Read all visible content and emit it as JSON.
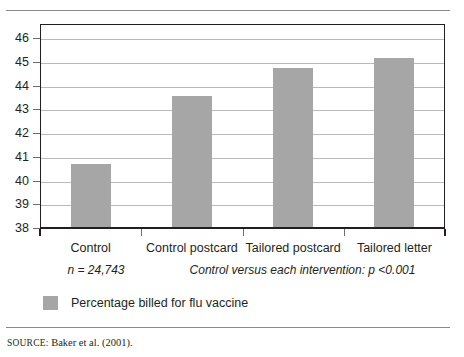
{
  "chart_data": {
    "type": "bar",
    "title": "",
    "subtitle": "",
    "xlabel": "",
    "ylabel": "",
    "categories": [
      "Control",
      "Control postcard",
      "Tailored postcard",
      "Tailored letter"
    ],
    "values": [
      40.7,
      43.55,
      44.75,
      45.15
    ],
    "series": [
      {
        "name": "Percentage billed for flu vaccine",
        "values": [
          40.7,
          43.55,
          44.75,
          45.15
        ],
        "color": "#a6a6a6"
      }
    ],
    "ylim": [
      38,
      46.6
    ],
    "yticks": [
      38,
      39,
      40,
      41,
      42,
      43,
      44,
      45,
      46
    ],
    "ytick_labels": [
      "38",
      "39",
      "40",
      "41",
      "42",
      "43",
      "44",
      "45",
      "46"
    ],
    "grid": true,
    "legend_position": "below-left",
    "annotations": [
      "n = 24,743",
      "Control versus each intervention: p <0.001"
    ]
  },
  "notes": {
    "sample_size": "n = 24,743",
    "significance": "Control versus each intervention: p <0.001"
  },
  "legend": {
    "items": [
      {
        "label": "Percentage billed for flu vaccine",
        "color": "#a6a6a6"
      }
    ]
  },
  "footer": {
    "source_word": "SOURCE:",
    "source_text": " Baker et al. (2001)."
  },
  "colors": {
    "bar": "#a6a6a6",
    "axis": "#231f20",
    "grid": "#b9b9b9",
    "rule": "#8a8a8a"
  }
}
